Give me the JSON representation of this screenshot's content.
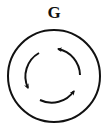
{
  "figure": {
    "label": "G",
    "stroke_color": "#111111",
    "background_color": "#ffffff",
    "outer_circle": {
      "cx": 54,
      "cy": 76,
      "r": 46
    },
    "arrows": [
      {
        "name": "top-right-arrow",
        "direction": "clockwise"
      },
      {
        "name": "left-arrow",
        "direction": "clockwise"
      },
      {
        "name": "bottom-arrow",
        "direction": "clockwise"
      }
    ]
  }
}
